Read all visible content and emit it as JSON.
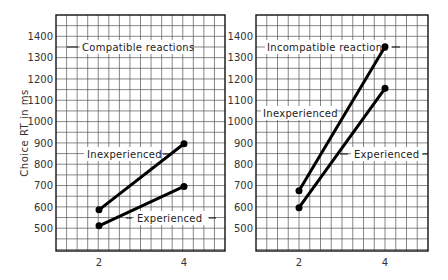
{
  "chart_data": [
    {
      "type": "line",
      "title": "Compatible reactions",
      "xlabel": "",
      "ylabel": "Choice RT in ms",
      "x": [
        2,
        4
      ],
      "x_ticks": [
        "2",
        "4"
      ],
      "y_ticks": [
        "500",
        "600",
        "700",
        "800",
        "900",
        "1000",
        "1100",
        "1200",
        "1300",
        "1400"
      ],
      "ylim": [
        400,
        1500
      ],
      "grid": true,
      "series": [
        {
          "name": "Inexperienced",
          "values": [
            585,
            895
          ]
        },
        {
          "name": "Experienced",
          "values": [
            510,
            695
          ]
        }
      ]
    },
    {
      "type": "line",
      "title": "Incompatible reactions",
      "xlabel": "",
      "ylabel": "",
      "x": [
        2,
        4
      ],
      "x_ticks": [
        "2",
        "4"
      ],
      "y_ticks": [
        "500",
        "600",
        "700",
        "800",
        "900",
        "1000",
        "1100",
        "1200",
        "1300",
        "1400"
      ],
      "ylim": [
        400,
        1500
      ],
      "grid": true,
      "series": [
        {
          "name": "Inexperienced",
          "values": [
            675,
            1350
          ]
        },
        {
          "name": "Experienced",
          "values": [
            595,
            1155
          ]
        }
      ]
    }
  ],
  "labels": {
    "ylabel": "Choice RT in ms",
    "left_title": "Compatible reactions",
    "right_title": "Incompatible reactions",
    "left_inexp": "Inexperienced",
    "left_exp": "Experienced",
    "right_inexp": "Inexperienced",
    "right_exp": "Experienced",
    "x2": "2",
    "x4": "4"
  }
}
